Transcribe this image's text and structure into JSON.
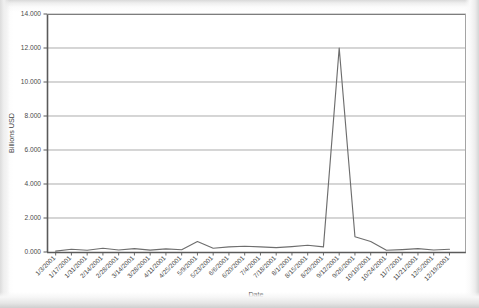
{
  "chart_data": {
    "type": "line",
    "title": "",
    "xlabel": "Date",
    "ylabel": "Billions USD",
    "ylim": [
      0,
      14
    ],
    "ytick_labels": [
      "0.000",
      "2.000",
      "4.000",
      "6.000",
      "8.000",
      "10.000",
      "12.000",
      "14.000"
    ],
    "ytick_values": [
      0,
      2,
      4,
      6,
      8,
      10,
      12,
      14
    ],
    "grid": "horizontal",
    "legend": "none",
    "units": "Billions USD",
    "categories": [
      "1/3/2001",
      "1/17/2001",
      "1/31/2001",
      "2/14/2001",
      "2/28/2001",
      "3/14/2001",
      "3/28/2001",
      "4/11/2001",
      "4/25/2001",
      "5/9/2001",
      "5/23/2001",
      "6/6/2001",
      "6/20/2001",
      "7/4/2001",
      "7/18/2001",
      "8/1/2001",
      "8/15/2001",
      "8/29/2001",
      "9/12/2001",
      "9/26/2001",
      "10/10/2001",
      "10/24/2001",
      "11/7/2001",
      "11/21/2001",
      "12/5/2001",
      "12/19/2001"
    ],
    "values": [
      0.05,
      0.16,
      0.1,
      0.22,
      0.12,
      0.2,
      0.11,
      0.18,
      0.13,
      0.62,
      0.22,
      0.3,
      0.34,
      0.3,
      0.26,
      0.32,
      0.4,
      0.3,
      12.0,
      0.9,
      0.62,
      0.1,
      0.14,
      0.2,
      0.12,
      0.16
    ],
    "peak": {
      "label": "9/12/2001",
      "value": 12.0
    }
  }
}
